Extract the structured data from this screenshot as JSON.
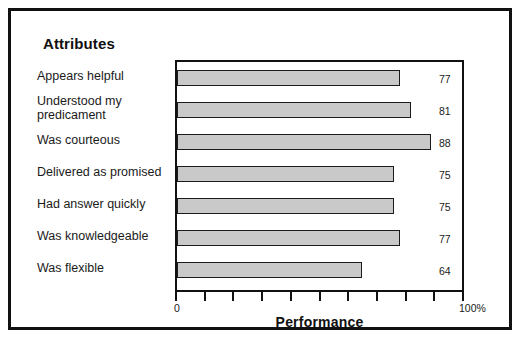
{
  "figure": {
    "title": "Attributes",
    "border_color": "#111111",
    "bar_fill_color": "#c9c9c9",
    "bar_edge_color": "#1b1b1b"
  },
  "axis": {
    "x_title": "Performance",
    "x_min_label": "0",
    "x_max_label": "100%",
    "tick_count": 11
  },
  "chart_data": {
    "type": "bar",
    "orientation": "horizontal",
    "title": "Attributes",
    "xlabel": "Performance",
    "ylabel": "",
    "xlim": [
      0,
      100
    ],
    "grid": false,
    "legend": false,
    "categories": [
      "Appears helpful",
      "Understood my predicament",
      "Was courteous",
      "Delivered as promised",
      "Had answer quickly",
      "Was knowledgeable",
      "Was flexible"
    ],
    "values": [
      77,
      81,
      88,
      75,
      75,
      77,
      64
    ],
    "value_labels": [
      "77",
      "81",
      "88",
      "75",
      "75",
      "77",
      "64"
    ],
    "tick_labels": [
      "0",
      "",
      "",
      "",
      "",
      "",
      "",
      "",
      "",
      "",
      "100%"
    ]
  }
}
